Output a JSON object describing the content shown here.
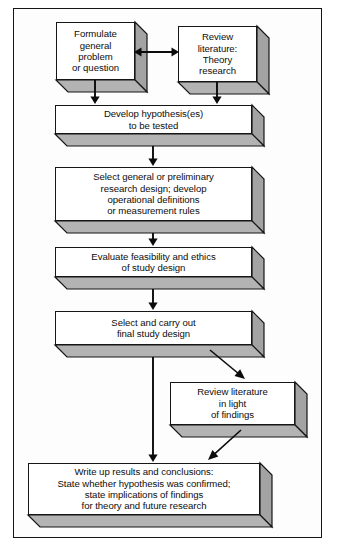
{
  "diagram": {
    "colors": {
      "face": "#ffffff",
      "side_shade": "#a3a3a3",
      "bottom_shade": "#b3b3b3",
      "outline": "#161616",
      "frame": "#151515",
      "arrow": "#0b0b0b"
    },
    "nodes": [
      {
        "id": "formulate",
        "text": "Formulate\ngeneral\nproblem\nor question",
        "x": 56,
        "y": 22,
        "w": 79,
        "h": 58,
        "d": 12
      },
      {
        "id": "review-theory",
        "text": "Review\nliterature:\nTheory\nresearch",
        "x": 178,
        "y": 26,
        "w": 79,
        "h": 56,
        "d": 12
      },
      {
        "id": "develop-hypothesis",
        "text": "Develop hypothesis(es)\nto be tested",
        "x": 55,
        "y": 105,
        "w": 197,
        "h": 29,
        "d": 12
      },
      {
        "id": "select-design",
        "text": "Select general or preliminary\nresearch design; develop\noperational definitions\nor measurement rules",
        "x": 55,
        "y": 167,
        "w": 197,
        "h": 54,
        "d": 12
      },
      {
        "id": "evaluate-feasibility",
        "text": "Evaluate feasibility and ethics\nof study design",
        "x": 55,
        "y": 247,
        "w": 197,
        "h": 30,
        "d": 12
      },
      {
        "id": "carry-out-design",
        "text": "Select and carry out\nfinal study design",
        "x": 55,
        "y": 311,
        "w": 197,
        "h": 34,
        "d": 12
      },
      {
        "id": "review-findings",
        "text": "Review literature\nin light\nof findings",
        "x": 170,
        "y": 382,
        "w": 125,
        "h": 43,
        "d": 12
      },
      {
        "id": "write-up",
        "text": "Write up results and conclusions:\nState whether hypothesis was confirmed;\nstate implications of findings\nfor theory and future research",
        "x": 28,
        "y": 463,
        "w": 232,
        "h": 52,
        "d": 12
      }
    ],
    "connectors": [
      {
        "id": "formulate-to-review",
        "type": "double-horizontal",
        "from": [
          134,
          52
        ],
        "to": [
          179,
          52
        ]
      },
      {
        "id": "formulate-to-hypothesis",
        "type": "vertical",
        "from": [
          95,
          80
        ],
        "to": [
          95,
          104
        ]
      },
      {
        "id": "review-to-hypothesis",
        "type": "vertical",
        "from": [
          217,
          82
        ],
        "to": [
          217,
          104
        ]
      },
      {
        "id": "hypothesis-to-design",
        "type": "vertical",
        "from": [
          153,
          146
        ],
        "to": [
          153,
          166
        ]
      },
      {
        "id": "design-to-evaluate",
        "type": "vertical",
        "from": [
          153,
          233
        ],
        "to": [
          153,
          246
        ]
      },
      {
        "id": "evaluate-to-carryout",
        "type": "vertical",
        "from": [
          153,
          289
        ],
        "to": [
          153,
          310
        ]
      },
      {
        "id": "carryout-to-writeup",
        "type": "vertical",
        "from": [
          153,
          357
        ],
        "to": [
          153,
          462
        ]
      },
      {
        "id": "carryout-to-reviewfindings",
        "type": "diagonal",
        "from": [
          210,
          350
        ],
        "to": [
          245,
          379
        ]
      },
      {
        "id": "reviewfindings-to-writeup",
        "type": "diagonal",
        "from": [
          241,
          430
        ],
        "to": [
          208,
          460
        ]
      }
    ]
  }
}
